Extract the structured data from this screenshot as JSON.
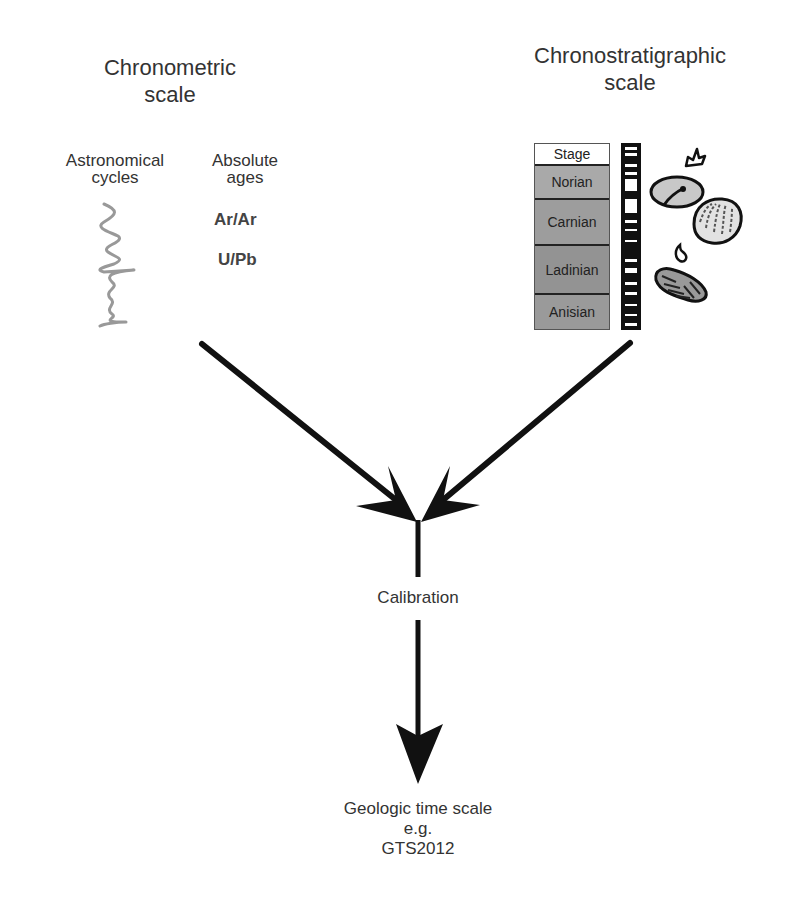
{
  "title_fragment": "... ",
  "left": {
    "heading_line1": "Chronometric",
    "heading_line2": "scale",
    "astro": {
      "line1": "Astronomical",
      "line2": "cycles",
      "icon": "astronomical-cycles-curve-icon",
      "color": "#999999"
    },
    "absolute": {
      "line1": "Absolute",
      "line2": "ages",
      "methods": [
        "Ar/Ar",
        "U/Pb"
      ]
    }
  },
  "right": {
    "heading_line1": "Chronostratigraphic",
    "heading_line2": "scale",
    "stage_header": "Stage",
    "stages": [
      {
        "label": "Norian",
        "color": "#a9a9a9"
      },
      {
        "label": "Carnian",
        "color": "#9d9d9d"
      },
      {
        "label": "Ladinian",
        "color": "#939393"
      },
      {
        "label": "Anisian",
        "color": "#9a9a9a"
      }
    ],
    "icons": [
      "magnetostratigraphy-column-icon",
      "conodont-fossil-icon",
      "ostracod-fossil-icon",
      "bivalve-fossil-icon",
      "gastropod-fossil-icon",
      "ammonoid-fossil-icon"
    ]
  },
  "center": {
    "calibration": "Calibration",
    "result_line1": "Geologic time scale",
    "result_line2": "e.g.",
    "result_line3": "GTS2012"
  },
  "colors": {
    "arrow": "#111111",
    "text": "#333333"
  }
}
